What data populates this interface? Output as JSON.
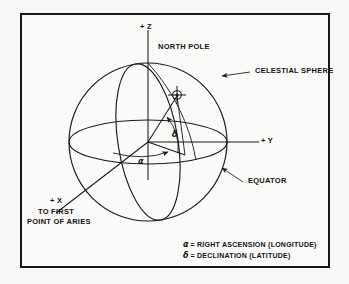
{
  "figure": {
    "background_color": "#f7f7f5",
    "frame_color": "#17171a",
    "line_color": "#1a1a1c"
  },
  "axes": {
    "z_label": "+ Z",
    "y_label": "+ Y",
    "x_label": "+ X",
    "x_sub_line1": "TO FIRST",
    "x_sub_line2": "POINT OF ARIES"
  },
  "callouts": {
    "north_pole": "NORTH POLE",
    "celestial_sphere": "CELESTIAL SPHERE",
    "equator": "EQUATOR"
  },
  "angles": {
    "alpha_symbol": "α",
    "delta_symbol": "δ"
  },
  "legend": {
    "line1_symbol": "α",
    "line1_text": "= RIGHT ASCENSION (LONGITUDE)",
    "line2_symbol": "δ",
    "line2_text": "= DECLINATION (LATITUDE)"
  },
  "icons": {
    "object_marker": "crosshair-circle-icon",
    "celestial_sphere_pointer": "arrow-icon",
    "equator_pointer": "arrow-icon",
    "alpha_arc_arrow": "arrow-icon",
    "delta_arc_arrow": "arrow-icon"
  },
  "geometry": {
    "sphere_center_x": 148,
    "sphere_center_y": 142,
    "sphere_radius": 79,
    "equator_semi_minor": 22
  }
}
